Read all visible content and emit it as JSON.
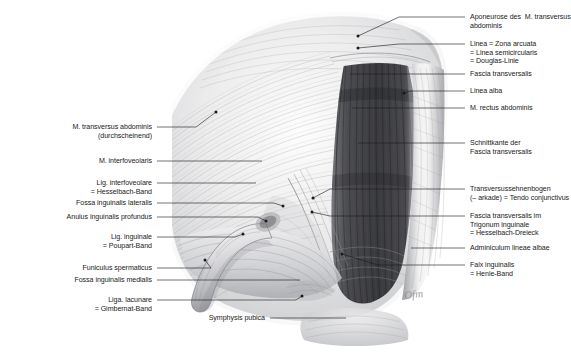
{
  "figure": {
    "style": "graphite-pencil-anatomical-illustration",
    "background_color": "#ffffff",
    "ink_color": "#1b1b1b",
    "signature": "Ofm"
  },
  "labels_right": [
    {
      "id": "aponeurose-transversus",
      "lines": [
        "Aponeurose des  M. transversus",
        "abdominis"
      ],
      "text_x": 470,
      "text_y": 14,
      "dash_x": 455,
      "dash_y": 17,
      "leader": {
        "x1": 465,
        "y1": 17,
        "x2": 399,
        "y2": 17,
        "x3": 358,
        "y3": 36
      },
      "dot": {
        "x": 358,
        "y": 36
      }
    },
    {
      "id": "linea-arcuata",
      "lines": [
        "Linea = Zona arcuata",
        "= Linea semicircularis",
        "= Douglas-Linie"
      ],
      "text_x": 470,
      "text_y": 41,
      "dash_x": 455,
      "dash_y": 44,
      "leader": {
        "x1": 465,
        "y1": 44,
        "x2": 399,
        "y2": 44,
        "x3": 358,
        "y3": 48
      },
      "dot": {
        "x": 358,
        "y": 48
      }
    },
    {
      "id": "fascia-transversalis",
      "lines": [
        "Fascia transversalis"
      ],
      "text_x": 470,
      "text_y": 71,
      "dash_x": 455,
      "dash_y": 74,
      "leader": {
        "x1": 465,
        "y1": 74,
        "x2": 350,
        "y2": 74,
        "x3": 350,
        "y3": 74
      }
    },
    {
      "id": "linea-alba",
      "lines": [
        "Linea alba"
      ],
      "text_x": 470,
      "text_y": 88,
      "dash_x": 455,
      "dash_y": 91,
      "leader": {
        "x1": 465,
        "y1": 91,
        "x2": 410,
        "y2": 91,
        "x3": 404,
        "y3": 93
      },
      "dot": {
        "x": 404,
        "y": 93
      }
    },
    {
      "id": "rectus-abdominis",
      "lines": [
        "M. rectus abdominis"
      ],
      "text_x": 470,
      "text_y": 105,
      "dash_x": 455,
      "dash_y": 108,
      "leader": {
        "x1": 465,
        "y1": 108,
        "x2": 352,
        "y2": 108,
        "x3": 352,
        "y3": 108
      }
    },
    {
      "id": "schnittkante-fascia",
      "lines": [
        "Schnittkante der",
        "Fascia transversalis"
      ],
      "text_x": 470,
      "text_y": 140,
      "dash_x": 455,
      "dash_y": 143,
      "leader": {
        "x1": 465,
        "y1": 143,
        "x2": 358,
        "y2": 143,
        "x3": 358,
        "y3": 143
      }
    },
    {
      "id": "transversussehnenbogen",
      "lines": [
        "Transversussehnenbogen",
        "(– arkade) = Tendo conjunctivus"
      ],
      "text_x": 470,
      "text_y": 186,
      "dash_x": 455,
      "dash_y": 189,
      "leader": {
        "x1": 465,
        "y1": 189,
        "x2": 330,
        "y2": 189,
        "x3": 313,
        "y3": 198
      },
      "dot": {
        "x": 313,
        "y": 198
      }
    },
    {
      "id": "hesselbach-dreieck",
      "lines": [
        "Fascia transversalis im",
        "Trigonum inguinale",
        "= Hesselbach-Dreieck"
      ],
      "text_x": 470,
      "text_y": 213,
      "dash_x": 455,
      "dash_y": 216,
      "leader": {
        "x1": 465,
        "y1": 216,
        "x2": 330,
        "y2": 216,
        "x3": 312,
        "y3": 212
      },
      "dot": {
        "x": 312,
        "y": 212
      }
    },
    {
      "id": "adminiculum-lineae-albae",
      "lines": [
        "Adminiculum lineae albae"
      ],
      "text_x": 470,
      "text_y": 245,
      "dash_x": 455,
      "dash_y": 248,
      "leader": {
        "x1": 465,
        "y1": 248,
        "x2": 411,
        "y2": 248,
        "x3": 411,
        "y3": 248
      }
    },
    {
      "id": "falx-inguinalis",
      "lines": [
        "Falx inguinalis",
        "= Henle-Band"
      ],
      "text_x": 470,
      "text_y": 262,
      "dash_x": 455,
      "dash_y": 265,
      "leader": {
        "x1": 465,
        "y1": 265,
        "x2": 378,
        "y2": 265,
        "x3": 342,
        "y3": 254
      },
      "dot": {
        "x": 342,
        "y": 254
      }
    }
  ],
  "labels_left": [
    {
      "id": "transversus-abdominis-durchscheinend",
      "lines": [
        "M. transversus abdominis",
        "(durchscheinend)"
      ],
      "text_right": 152,
      "text_y": 124,
      "leader": {
        "x1": 157,
        "y1": 127,
        "x2": 196,
        "y2": 127,
        "x3": 216,
        "y3": 112
      },
      "dot": {
        "x": 216,
        "y": 112
      }
    },
    {
      "id": "interfoveolaris",
      "lines": [
        "M. interfoveolaris"
      ],
      "text_right": 152,
      "text_y": 158,
      "leader": {
        "x1": 157,
        "y1": 161,
        "x2": 262,
        "y2": 161,
        "x3": 262,
        "y3": 161
      }
    },
    {
      "id": "lig-interfoveolare",
      "lines": [
        "Lig. interfoveolare",
        "= Hesselbach-Band"
      ],
      "text_right": 152,
      "text_y": 180,
      "leader": {
        "x1": 157,
        "y1": 183,
        "x2": 256,
        "y2": 183,
        "x3": 256,
        "y3": 183
      }
    },
    {
      "id": "fossa-inguinalis-lateralis",
      "lines": [
        "Fossa inguinalis lateralis"
      ],
      "text_right": 152,
      "text_y": 200,
      "leader": {
        "x1": 157,
        "y1": 203,
        "x2": 274,
        "y2": 203,
        "x3": 283,
        "y3": 206
      },
      "dot": {
        "x": 283,
        "y": 206
      }
    },
    {
      "id": "anulus-inguinalis-profundus",
      "lines": [
        "Anulus inguinalis profundus"
      ],
      "text_right": 152,
      "text_y": 214,
      "leader": {
        "x1": 157,
        "y1": 217,
        "x2": 258,
        "y2": 217,
        "x3": 266,
        "y3": 221
      },
      "dot": {
        "x": 266,
        "y": 221
      }
    },
    {
      "id": "lig-inguinale",
      "lines": [
        "Lig. inguinale",
        "= Poupart-Band"
      ],
      "text_right": 152,
      "text_y": 234,
      "leader": {
        "x1": 157,
        "y1": 237,
        "x2": 235,
        "y2": 237,
        "x3": 243,
        "y3": 234
      },
      "dot": {
        "x": 243,
        "y": 234
      }
    },
    {
      "id": "funiculus-spermaticus",
      "lines": [
        "Funiculus spermaticus"
      ],
      "text_right": 152,
      "text_y": 265,
      "leader": {
        "x1": 157,
        "y1": 268,
        "x2": 211,
        "y2": 268,
        "x3": 205,
        "y3": 260
      },
      "dot": {
        "x": 205,
        "y": 260
      }
    },
    {
      "id": "fossa-inguinalis-medialis",
      "lines": [
        "Fossa inguinalis medialis"
      ],
      "text_right": 152,
      "text_y": 277,
      "leader": {
        "x1": 157,
        "y1": 280,
        "x2": 300,
        "y2": 280,
        "x3": 300,
        "y3": 280
      }
    },
    {
      "id": "liga-lacunare",
      "lines": [
        "Liga. lacunare",
        "= Gimbernat-Band"
      ],
      "text_right": 152,
      "text_y": 297,
      "leader": {
        "x1": 157,
        "y1": 300,
        "x2": 296,
        "y2": 300,
        "x3": 302,
        "y3": 296
      },
      "dot": {
        "x": 302,
        "y": 296
      }
    },
    {
      "id": "symphysis-pubica",
      "lines": [
        "Symphysis pubica"
      ],
      "text_right": 265,
      "text_y": 315,
      "leader": {
        "x1": 270,
        "y1": 318,
        "x2": 346,
        "y2": 318,
        "x3": 346,
        "y3": 318
      }
    }
  ]
}
